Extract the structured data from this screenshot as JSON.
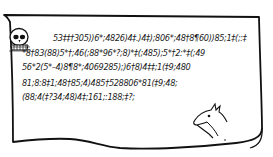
{
  "parchment": {
    "title": "Gold-Bug cipher parchment",
    "ink_color": "#1a1a1a",
    "background": "#ffffff",
    "drawings": [
      "skull-icon",
      "kid-goat-icon"
    ],
    "cipher_lines": [
      "53‡‡†305))6*;4826)4‡.)4‡);806*;48†8¶60))85;1‡(;:‡",
      "*8†83(88)5*†;46(;88*96*?;8)*‡(;485);5*†2:*‡(;49",
      "56*2(5*–4)8¶8*;4069285);)6†8)4‡‡;1(‡9;480",
      "81;8:8‡1;48†85;4)485†528806*81(‡9;48;",
      "(88;4(‡?34;48)4‡;161;:188;‡?;"
    ]
  }
}
